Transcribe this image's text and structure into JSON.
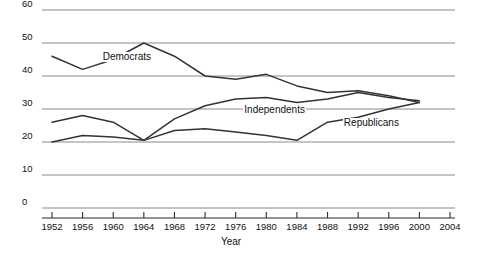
{
  "chart_data": {
    "type": "line",
    "title": "",
    "subtitle": "",
    "xlabel": "Year",
    "ylabel": "",
    "grid": true,
    "legend_position": "inline-labels",
    "xlim": [
      1950,
      2004
    ],
    "ylim": [
      0,
      60
    ],
    "x_ticks": [
      1952,
      1956,
      1960,
      1964,
      1968,
      1972,
      1976,
      1980,
      1984,
      1988,
      1992,
      1996,
      2000,
      2004
    ],
    "y_ticks": [
      0,
      10,
      20,
      30,
      40,
      50,
      60
    ],
    "x": [
      1952,
      1956,
      1960,
      1964,
      1968,
      1972,
      1976,
      1980,
      1984,
      1988,
      1992,
      1996,
      2000
    ],
    "series": [
      {
        "name": "Democrats",
        "label": "Democrats",
        "color": "#333333",
        "values": [
          46,
          42,
          45,
          50,
          46,
          40,
          39,
          40.5,
          37,
          35,
          35.5,
          34,
          32
        ]
      },
      {
        "name": "Independents",
        "label": "Independents",
        "color": "#333333",
        "values": [
          20,
          22,
          21.5,
          20.5,
          27,
          31,
          33,
          33.5,
          32,
          33,
          35,
          33.5,
          32.5
        ]
      },
      {
        "name": "Republicans",
        "label": "Republicans",
        "color": "#333333",
        "values": [
          26,
          28,
          26,
          20.5,
          23.5,
          24,
          23,
          22,
          20.5,
          26,
          27.5,
          30,
          32
        ]
      }
    ],
    "annotations": [
      {
        "text": "Democrats",
        "x": 1958.5,
        "y": 45.5
      },
      {
        "text": "Independents",
        "x": 1977,
        "y": 29.5
      },
      {
        "text": "Republicans",
        "x": 1990,
        "y": 25.5
      }
    ]
  },
  "axis": {
    "x_title": "Year"
  }
}
